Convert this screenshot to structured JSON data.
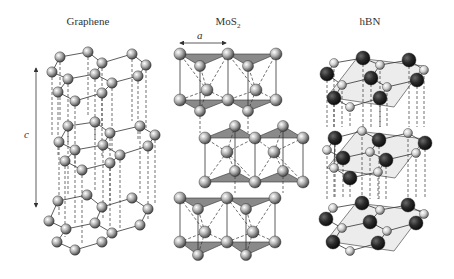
{
  "panels": [
    {
      "title": "Graphene"
    },
    {
      "title": "MoS",
      "subscript": "2"
    },
    {
      "title": "hBN"
    }
  ],
  "labels": {
    "c_axis": "c",
    "a_axis": "a"
  },
  "colors": {
    "atom_gray": "#a9a9a9",
    "atom_dark": "#2a2a2a",
    "atom_light": "#cfcfcf",
    "triangle_fill": "#8a8a8a",
    "hbn_plane_fill": "#ececec",
    "line": "#333333"
  },
  "structures": {
    "graphene": {
      "layers": [
        {
          "atoms": [
            [
              60,
              57
            ],
            [
              88,
              52
            ],
            [
              102,
              63
            ],
            [
              132,
              54
            ],
            [
              146,
              65
            ],
            [
              52,
              72
            ],
            [
              68,
              79
            ],
            [
              95,
              74
            ],
            [
              112,
              83
            ],
            [
              138,
              76
            ],
            [
              58,
              92
            ],
            [
              75,
              101
            ],
            [
              102,
              93
            ]
          ]
        },
        {
          "atoms": [
            [
              68,
              126
            ],
            [
              95,
              122
            ],
            [
              110,
              133
            ],
            [
              140,
              126
            ],
            [
              155,
              135
            ],
            [
              59,
              142
            ],
            [
              75,
              150
            ],
            [
              103,
              145
            ],
            [
              120,
              155
            ],
            [
              148,
              146
            ],
            [
              65,
              161
            ],
            [
              82,
              170
            ],
            [
              110,
              163
            ]
          ]
        },
        {
          "atoms": [
            [
              58,
              201
            ],
            [
              87,
              195
            ],
            [
              102,
              207
            ],
            [
              132,
              198
            ],
            [
              148,
              209
            ],
            [
              49,
              221
            ],
            [
              66,
              229
            ],
            [
              95,
              223
            ],
            [
              112,
              233
            ],
            [
              140,
              225
            ],
            [
              57,
              242
            ],
            [
              75,
              250
            ],
            [
              102,
              242
            ]
          ]
        }
      ]
    },
    "mos2": {
      "blocks": [
        {
          "top": [
            [
              180,
              54
            ],
            [
              228,
              54
            ],
            [
              276,
              54
            ]
          ],
          "back_top": [
            [
              200,
              66
            ],
            [
              248,
              66
            ]
          ],
          "mo": [
            [
              207,
              90
            ],
            [
              256,
              90
            ]
          ],
          "bottom": [
            [
              180,
              100
            ],
            [
              228,
              100
            ],
            [
              276,
              100
            ]
          ],
          "back_bottom": [
            [
              200,
              111
            ],
            [
              248,
              111
            ]
          ]
        },
        {
          "top": [
            [
              205,
              138
            ],
            [
              255,
              138
            ],
            [
              303,
              138
            ]
          ],
          "back_top": [
            [
              235,
              126
            ],
            [
              283,
              126
            ]
          ],
          "mo": [
            [
              227,
              152
            ],
            [
              274,
              152
            ]
          ],
          "bottom": [
            [
              205,
              182
            ],
            [
              255,
              182
            ],
            [
              303,
              182
            ]
          ],
          "back_bottom": [
            [
              235,
              171
            ],
            [
              283,
              171
            ]
          ]
        },
        {
          "top": [
            [
              180,
              198
            ],
            [
              227,
              198
            ],
            [
              275,
              198
            ]
          ],
          "back_top": [
            [
              198,
              209
            ],
            [
              246,
              209
            ]
          ],
          "mo": [
            [
              205,
              232
            ],
            [
              253,
              232
            ]
          ],
          "bottom": [
            [
              180,
              242
            ],
            [
              227,
              242
            ],
            [
              275,
              242
            ]
          ],
          "back_bottom": [
            [
              198,
              255
            ],
            [
              246,
              255
            ]
          ]
        }
      ]
    },
    "hbn": {
      "layers": [
        {
          "n": [
            [
              363,
              58
            ],
            [
              409,
              60
            ],
            [
              327,
              74
            ],
            [
              371,
              78
            ],
            [
              417,
              80
            ],
            [
              334,
              98
            ],
            [
              380,
              98
            ]
          ],
          "b": [
            [
              334,
              63
            ],
            [
              380,
              65
            ],
            [
              424,
              70
            ],
            [
              342,
              85
            ],
            [
              387,
              87
            ],
            [
              350,
              107
            ]
          ]
        },
        {
          "n": [
            [
              335,
              138
            ],
            [
              379,
              140
            ],
            [
              425,
              143
            ],
            [
              343,
              158
            ],
            [
              386,
              160
            ],
            [
              350,
              178
            ]
          ],
          "b": [
            [
              362,
              131
            ],
            [
              408,
              133
            ],
            [
              327,
              150
            ],
            [
              370,
              152
            ],
            [
              416,
              153
            ],
            [
              334,
              168
            ],
            [
              378,
              172
            ]
          ]
        },
        {
          "n": [
            [
              362,
              203
            ],
            [
              408,
              205
            ],
            [
              326,
              219
            ],
            [
              370,
              222
            ],
            [
              416,
              223
            ],
            [
              333,
              242
            ],
            [
              378,
              243
            ]
          ],
          "b": [
            [
              333,
              208
            ],
            [
              380,
              210
            ],
            [
              424,
              214
            ],
            [
              342,
              228
            ],
            [
              387,
              231
            ],
            [
              350,
              251
            ]
          ]
        }
      ]
    }
  }
}
